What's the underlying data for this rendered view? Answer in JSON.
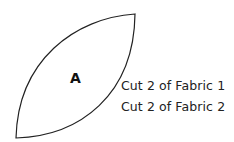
{
  "pattern_piece": {
    "label": "A",
    "shape": "leaf / melon",
    "stroke_color": "#222222",
    "fill_color": "#ffffff"
  },
  "instructions": [
    {
      "text": "Cut 2 of Fabric 1"
    },
    {
      "text": "Cut 2 of Fabric 2"
    }
  ]
}
